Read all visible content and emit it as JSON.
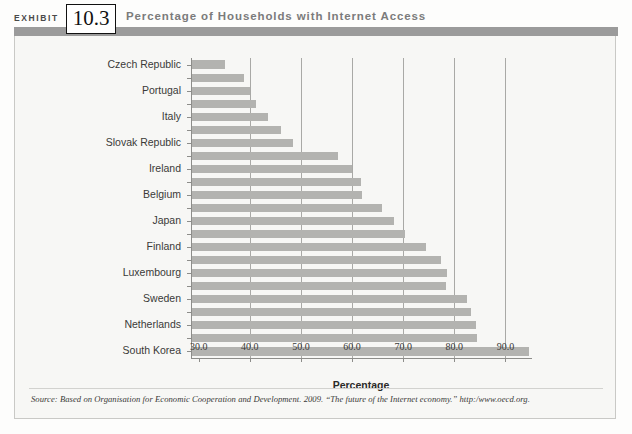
{
  "header": {
    "exhibit_label": "EXHIBIT",
    "exhibit_number": "10.3",
    "title": "Percentage of Households with Internet Access"
  },
  "source": {
    "text": "Source: Based on Organisation for Economic Cooperation and Development. 2009. “The future of the Internet economy.”  http:/www.oecd.org."
  },
  "chart_data": {
    "type": "bar",
    "orientation": "horizontal",
    "title": "Percentage of Households with Internet Access",
    "xlabel": "Percentage",
    "ylabel": "",
    "xlim": [
      28.5,
      95.0
    ],
    "xticks": [
      30.0,
      40.0,
      50.0,
      60.0,
      70.0,
      80.0,
      90.0
    ],
    "xtick_labels": [
      "30.0",
      "40.0",
      "50.0",
      "60.0",
      "70.0",
      "80.0",
      "90.0"
    ],
    "grid": "vertical",
    "legend": "none",
    "bar_color": "#b3b3b0",
    "categories": [
      "Czech Republic",
      "",
      "Portugal",
      "",
      "Italy",
      "",
      "Slovak Republic",
      "",
      "Ireland",
      "",
      "Belgium",
      "",
      "Japan",
      "",
      "Finland",
      "",
      "Luxembourg",
      "",
      "Sweden",
      "",
      "Netherlands",
      "",
      "South Korea"
    ],
    "visible_labels": [
      "Czech Republic",
      "Portugal",
      "Italy",
      "Slovak Republic",
      "Ireland",
      "Belgium",
      "Japan",
      "Finland",
      "Luxembourg",
      "Sweden",
      "Netherlands",
      "South Korea"
    ],
    "values": [
      35.0,
      38.6,
      39.9,
      41.0,
      43.3,
      46.0,
      48.2,
      57.0,
      59.8,
      61.5,
      61.8,
      65.7,
      68.0,
      70.1,
      74.3,
      77.2,
      78.3,
      78.2,
      82.3,
      83.1,
      94.1,
      84.0,
      94.4
    ],
    "bars": [
      {
        "label": "Czech Republic",
        "value": 35.0
      },
      {
        "label": "",
        "value": 38.6
      },
      {
        "label": "Portugal",
        "value": 39.9
      },
      {
        "label": "",
        "value": 41.0
      },
      {
        "label": "Italy",
        "value": 43.3
      },
      {
        "label": "",
        "value": 46.0
      },
      {
        "label": "Slovak Republic",
        "value": 48.2
      },
      {
        "label": "",
        "value": 57.0
      },
      {
        "label": "Ireland",
        "value": 59.8
      },
      {
        "label": "",
        "value": 61.5
      },
      {
        "label": "Belgium",
        "value": 61.8
      },
      {
        "label": "",
        "value": 65.7
      },
      {
        "label": "Japan",
        "value": 68.0
      },
      {
        "label": "",
        "value": 70.1
      },
      {
        "label": "Finland",
        "value": 74.3
      },
      {
        "label": "",
        "value": 77.2
      },
      {
        "label": "Luxembourg",
        "value": 78.3
      },
      {
        "label": "",
        "value": 78.2
      },
      {
        "label": "Sweden",
        "value": 82.3
      },
      {
        "label": "",
        "value": 83.1
      },
      {
        "label": "Netherlands",
        "value": 84.0
      },
      {
        "label": "",
        "value": 84.2
      },
      {
        "label": "South Korea",
        "value": 94.4
      }
    ]
  }
}
